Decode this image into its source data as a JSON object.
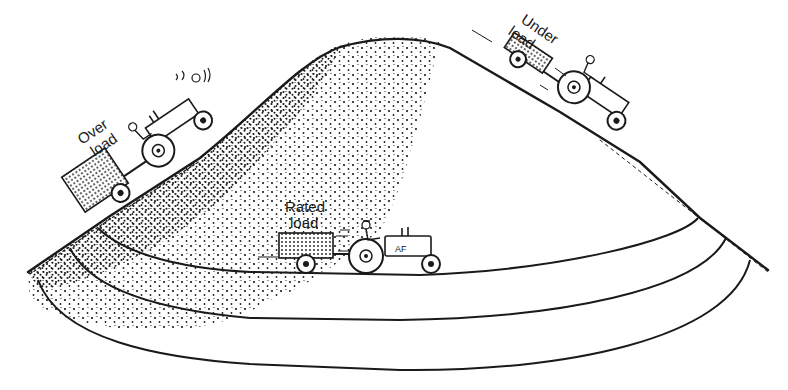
{
  "figure": {
    "colors": {
      "ink": "#1a1a1a",
      "background": "#ffffff"
    },
    "labels": {
      "over_load": [
        "Over",
        "load"
      ],
      "under_load": [
        "Under",
        "load"
      ],
      "rated_load": [
        "Rated",
        "load"
      ]
    },
    "elements": [
      {
        "name": "hill",
        "description": "stippled hill with crest at top center"
      },
      {
        "name": "tractor-over-load",
        "position": "left slope climbing up",
        "label": "Over load"
      },
      {
        "name": "tractor-under-load",
        "position": "right slope descending",
        "label": "Under load"
      },
      {
        "name": "tractor-rated-load",
        "position": "level road at base",
        "label": "Rated load"
      },
      {
        "name": "road-curves",
        "count": 3
      }
    ]
  }
}
